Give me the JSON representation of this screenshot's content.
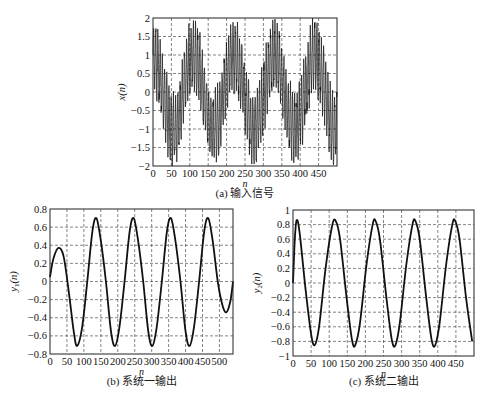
{
  "chart_data": [
    {
      "id": "a",
      "type": "line",
      "title": "",
      "caption": "(a) 输入信号",
      "xlabel": "n",
      "ylabel": "x(n)",
      "xlim": [
        0,
        500
      ],
      "ylim": [
        -2,
        2
      ],
      "xticks": [
        0,
        50,
        100,
        150,
        200,
        250,
        300,
        350,
        400,
        450
      ],
      "yticks": [
        -2,
        -1.5,
        -1,
        -0.5,
        0,
        0.5,
        1,
        1.5,
        2
      ],
      "ytick_labels": [
        "−2",
        "−1.5",
        "−1",
        "−0.5",
        "0",
        "0.5",
        "1",
        "1.5",
        "2"
      ],
      "grid": true,
      "description": "Noisy sinusoid: low-frequency sine (amplitude ~1, period ~110) plus high-frequency component (amplitude ~0.85)",
      "components": [
        {
          "amplitude": 1.0,
          "period": 110,
          "phase_deg": 90
        },
        {
          "amplitude": 0.85,
          "period": 6,
          "phase_deg": 0
        }
      ],
      "box": {
        "x": 153,
        "y": 18,
        "w": 184,
        "h": 148
      }
    },
    {
      "id": "b",
      "type": "line",
      "caption": "(b) 系统一输出",
      "xlabel": "n",
      "ylabel": "y1(n)",
      "xlim": [
        0,
        540
      ],
      "ylim": [
        -0.8,
        0.8
      ],
      "xticks": [
        0,
        50,
        100,
        150,
        200,
        250,
        300,
        350,
        400,
        450,
        500
      ],
      "yticks": [
        -0.8,
        -0.6,
        -0.4,
        -0.2,
        0,
        0.2,
        0.4,
        0.6,
        0.8
      ],
      "ytick_labels": [
        "−0.8",
        "−0.6",
        "−0.4",
        "−0.2",
        "0",
        "0.2",
        "0.4",
        "0.6",
        "0.8"
      ],
      "grid": true,
      "points": [
        [
          0,
          0.05
        ],
        [
          10,
          0.25
        ],
        [
          25,
          0.37
        ],
        [
          40,
          0.28
        ],
        [
          55,
          -0.1
        ],
        [
          70,
          -0.55
        ],
        [
          80,
          -0.71
        ],
        [
          95,
          -0.5
        ],
        [
          110,
          0.0
        ],
        [
          125,
          0.55
        ],
        [
          137,
          0.7
        ],
        [
          150,
          0.45
        ],
        [
          165,
          0.0
        ],
        [
          180,
          -0.55
        ],
        [
          192,
          -0.71
        ],
        [
          205,
          -0.5
        ],
        [
          220,
          0.0
        ],
        [
          235,
          0.55
        ],
        [
          247,
          0.7
        ],
        [
          260,
          0.45
        ],
        [
          275,
          0.0
        ],
        [
          290,
          -0.55
        ],
        [
          302,
          -0.71
        ],
        [
          315,
          -0.5
        ],
        [
          330,
          0.0
        ],
        [
          345,
          0.55
        ],
        [
          357,
          0.7
        ],
        [
          370,
          0.45
        ],
        [
          385,
          0.0
        ],
        [
          400,
          -0.55
        ],
        [
          412,
          -0.71
        ],
        [
          425,
          -0.5
        ],
        [
          440,
          0.0
        ],
        [
          455,
          0.55
        ],
        [
          467,
          0.7
        ],
        [
          480,
          0.45
        ],
        [
          495,
          0.0
        ],
        [
          508,
          -0.25
        ],
        [
          520,
          -0.34
        ],
        [
          532,
          -0.22
        ],
        [
          540,
          0.0
        ]
      ],
      "box": {
        "x": 50,
        "y": 209,
        "w": 183,
        "h": 145
      }
    },
    {
      "id": "c",
      "type": "line",
      "caption": "(c) 系统二输出",
      "xlabel": "n",
      "ylabel": "y2(n)",
      "xlim": [
        0,
        500
      ],
      "ylim": [
        -1,
        1
      ],
      "xticks": [
        0,
        50,
        100,
        150,
        200,
        250,
        300,
        350,
        400,
        450
      ],
      "yticks": [
        -1,
        -0.8,
        -0.6,
        -0.4,
        -0.2,
        0,
        0.2,
        0.4,
        0.6,
        0.8,
        1
      ],
      "ytick_labels": [
        "−1",
        "−0.8",
        "−0.6",
        "−0.4",
        "−0.2",
        "0",
        "0.2",
        "0.4",
        "0.6",
        "0.8",
        "1"
      ],
      "grid": true,
      "points": [
        [
          0,
          0.0
        ],
        [
          5,
          0.6
        ],
        [
          10,
          0.86
        ],
        [
          18,
          0.7
        ],
        [
          35,
          -0.1
        ],
        [
          50,
          -0.7
        ],
        [
          60,
          -0.85
        ],
        [
          72,
          -0.6
        ],
        [
          90,
          0.2
        ],
        [
          108,
          0.78
        ],
        [
          118,
          0.85
        ],
        [
          130,
          0.6
        ],
        [
          148,
          -0.2
        ],
        [
          163,
          -0.78
        ],
        [
          172,
          -0.85
        ],
        [
          185,
          -0.55
        ],
        [
          203,
          0.25
        ],
        [
          220,
          0.8
        ],
        [
          228,
          0.85
        ],
        [
          240,
          0.6
        ],
        [
          258,
          -0.2
        ],
        [
          273,
          -0.78
        ],
        [
          283,
          -0.85
        ],
        [
          295,
          -0.55
        ],
        [
          313,
          0.25
        ],
        [
          330,
          0.8
        ],
        [
          338,
          0.85
        ],
        [
          350,
          0.6
        ],
        [
          368,
          -0.2
        ],
        [
          383,
          -0.78
        ],
        [
          393,
          -0.85
        ],
        [
          405,
          -0.55
        ],
        [
          423,
          0.25
        ],
        [
          440,
          0.8
        ],
        [
          448,
          0.85
        ],
        [
          460,
          0.6
        ],
        [
          478,
          -0.2
        ],
        [
          495,
          -0.8
        ]
      ],
      "box": {
        "x": 293,
        "y": 210,
        "w": 181,
        "h": 146
      }
    }
  ]
}
